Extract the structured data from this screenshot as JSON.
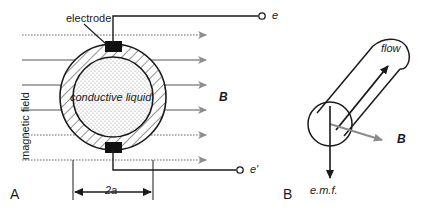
{
  "figure": {
    "panels": [
      {
        "id": "A",
        "label": "A",
        "labels": {
          "electrode": "electrode",
          "conductive_liquid": "conductive liquid",
          "magnetic_field": "magnetic field",
          "field_symbol": "B",
          "diameter": "2a",
          "terminal_top": "e",
          "terminal_bottom": "e'"
        },
        "field_arrow_count": 6
      },
      {
        "id": "B",
        "label": "B",
        "labels": {
          "flow": "flow",
          "field_symbol": "B",
          "emf": "e.m.f."
        }
      }
    ]
  },
  "colors": {
    "ink": "#1a1a1a",
    "field_arrow": "#8c8c8c",
    "background": "#ffffff",
    "hatch": "#333333",
    "stipple": "#9a9a9a"
  }
}
